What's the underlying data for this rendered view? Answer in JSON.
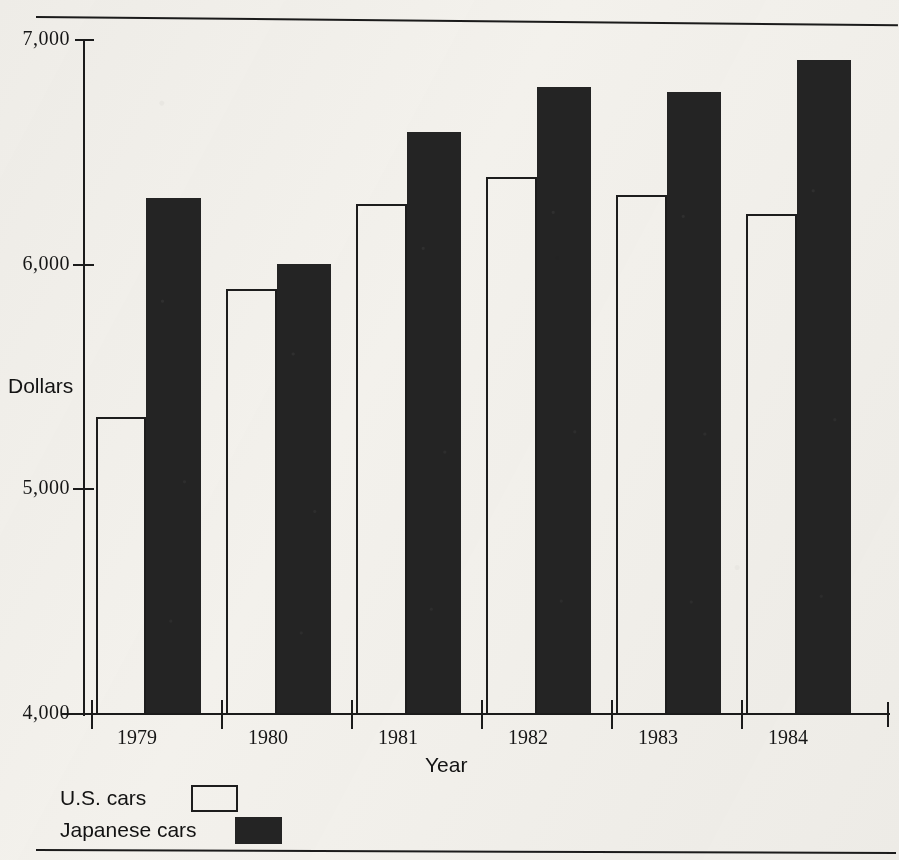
{
  "figure": {
    "y_axis_title": "Dollars",
    "x_axis_title": "Year"
  },
  "legend": {
    "items": [
      {
        "label": "U.S. cars",
        "swatch": "open-square",
        "color": "#f3f1ec"
      },
      {
        "label": "Japanese cars",
        "swatch": "filled-square",
        "color": "#242424"
      }
    ]
  },
  "chart_data": {
    "type": "bar",
    "title": "",
    "xlabel": "Year",
    "ylabel": "Dollars",
    "categories": [
      "1979",
      "1980",
      "1981",
      "1982",
      "1983",
      "1984"
    ],
    "series": [
      {
        "name": "U.S. cars",
        "color": "#f3f1ec",
        "values": [
          5320,
          5890,
          6270,
          6390,
          6310,
          6225
        ]
      },
      {
        "name": "Japanese cars",
        "color": "#242424",
        "values": [
          6295,
          6005,
          6590,
          6790,
          6770,
          6910
        ]
      }
    ],
    "ylim": [
      4000,
      7000
    ],
    "yticks": [
      4000,
      5000,
      6000,
      7000
    ],
    "ytick_labels": [
      "4,000",
      "5,000",
      "6,000",
      "7,000"
    ],
    "grid": false,
    "legend_position": "below-axes-left"
  }
}
